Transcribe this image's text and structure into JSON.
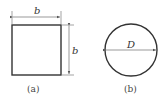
{
  "figure_a": {
    "caption": "(a)",
    "shape": "square",
    "dim_top": "b",
    "dim_right": "b"
  },
  "figure_b": {
    "caption": "(b)",
    "shape": "circle",
    "dim_diameter": "D"
  },
  "colors": {
    "stroke": "#333333",
    "text": "#444444"
  }
}
